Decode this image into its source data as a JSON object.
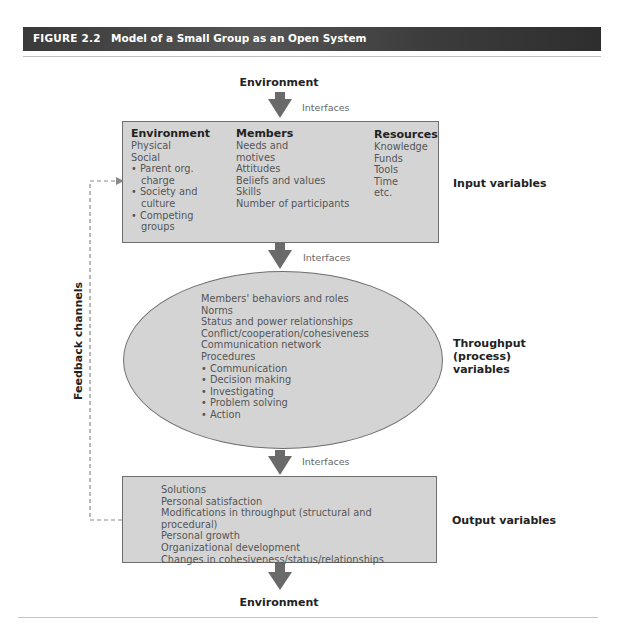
{
  "figure": {
    "number": "FIGURE 2.2",
    "title": "Model of a Small Group as an Open System"
  },
  "environment_top": "Environment",
  "environment_bottom": "Environment",
  "interfaces": [
    "Interfaces",
    "Interfaces",
    "Interfaces"
  ],
  "input_box": {
    "columns": [
      {
        "heading": "Environment",
        "items": [
          "Physical",
          "Social"
        ],
        "bullets": [
          "Parent org. charge",
          "Society and culture",
          "Competing groups"
        ]
      },
      {
        "heading": "Members",
        "items": [
          "Needs and motives",
          "Attitudes",
          "Beliefs and values",
          "Skills",
          "Number of participants"
        ]
      },
      {
        "heading": "Resources",
        "items": [
          "Knowledge",
          "Funds",
          "Tools",
          "Time",
          "etc."
        ]
      }
    ],
    "side_label": "Input variables"
  },
  "throughput": {
    "items": [
      "Members' behaviors and roles",
      "Norms",
      "Status and power relationships",
      "Conflict/cooperation/cohesiveness",
      "Communication network",
      "Procedures"
    ],
    "bullets": [
      "Communication",
      "Decision making",
      "Investigating",
      "Problem solving",
      "Action"
    ],
    "side_label_lines": [
      "Throughput",
      "(process)",
      "variables"
    ]
  },
  "output_box": {
    "items": [
      "Solutions",
      "Personal satisfaction",
      "Modifications in throughput (structural and procedural)",
      "Personal growth",
      "Organizational development",
      "Changes in cohesiveness/status/relationships"
    ],
    "side_label": "Output variables"
  },
  "feedback_label": "Feedback channels",
  "colors": {
    "header_bg": "#3e3e3e",
    "box_fill": "#d4d4d4",
    "arrow": "#6a6a6a",
    "feedback_line": "#8a8a8a"
  }
}
